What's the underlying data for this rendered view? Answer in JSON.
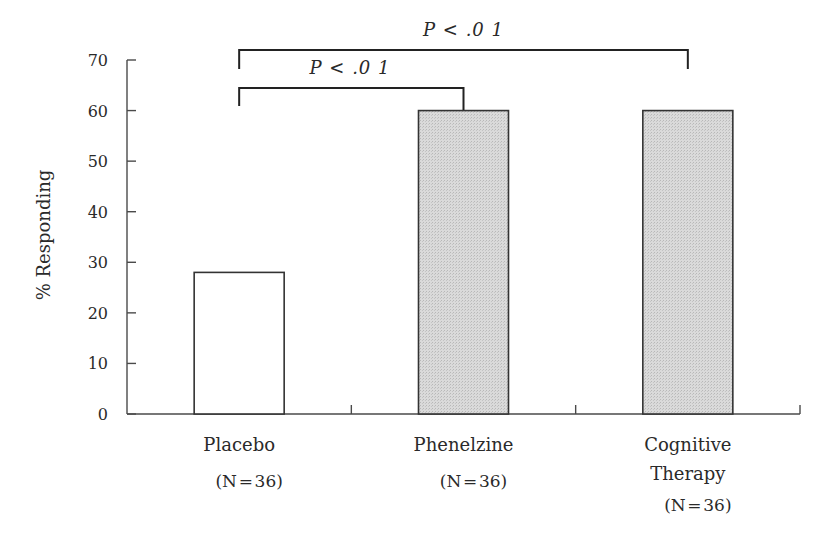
{
  "chart_data": {
    "type": "bar",
    "title": "",
    "xlabel": "",
    "ylabel": "% Responding",
    "ylim": [
      0,
      70
    ],
    "yticks": [
      0,
      10,
      20,
      30,
      40,
      50,
      60,
      70
    ],
    "grid": false,
    "categories": [
      "Placebo",
      "Phenelzine",
      "Cognitive Therapy"
    ],
    "category_lines": [
      [
        "Placebo"
      ],
      [
        "Phenelzine"
      ],
      [
        "Cognitive",
        "Therapy"
      ]
    ],
    "sample_sizes": [
      "(N = 36)",
      "(N = 36)",
      "(N = 36)"
    ],
    "values": [
      28,
      60,
      60
    ],
    "bar_fills": [
      "#ffffff",
      "#d6d6d6",
      "#d6d6d6"
    ],
    "annotations": [
      {
        "type": "significance-bracket",
        "from": "Placebo",
        "to": "Phenelzine",
        "label": "P < .0 1",
        "level": 1
      },
      {
        "type": "significance-bracket",
        "from": "Placebo",
        "to": "Cognitive Therapy",
        "label": "P < .0 1",
        "level": 2
      }
    ]
  }
}
